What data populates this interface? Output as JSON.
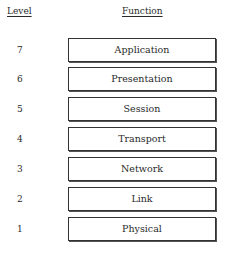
{
  "headers": {
    "level": "Level",
    "function": "Function"
  },
  "layers": [
    {
      "level": "7",
      "name": "Application"
    },
    {
      "level": "6",
      "name": "Presentation"
    },
    {
      "level": "5",
      "name": "Session"
    },
    {
      "level": "4",
      "name": "Transport"
    },
    {
      "level": "3",
      "name": "Network"
    },
    {
      "level": "2",
      "name": "Link"
    },
    {
      "level": "1",
      "name": "Physical"
    }
  ]
}
